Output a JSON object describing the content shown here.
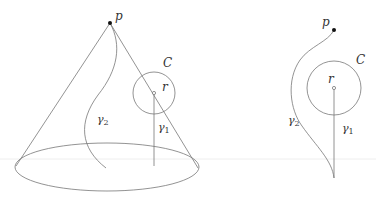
{
  "diagram": {
    "colors": {
      "stroke": "#777777",
      "point": "#111111",
      "guide": "#eeeeee"
    },
    "left_figure": {
      "labels": {
        "p": "p",
        "C": "C",
        "r": "r",
        "gamma2": "γ",
        "gamma2_sub": "2",
        "gamma1": "γ",
        "gamma1_sub": "1"
      }
    },
    "right_figure": {
      "labels": {
        "p": "p",
        "C": "C",
        "r": "r",
        "gamma2": "γ",
        "gamma2_sub": "2",
        "gamma1": "γ",
        "gamma1_sub": "1"
      }
    }
  }
}
